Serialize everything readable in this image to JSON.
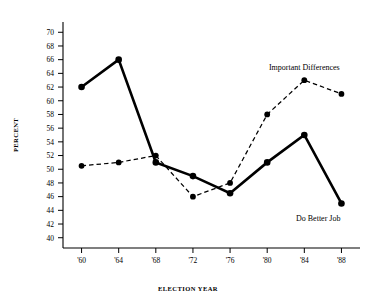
{
  "chart_data": {
    "type": "line",
    "title": "",
    "subtitle": "",
    "xlabel": "ELECTION YEAR",
    "ylabel": "PERCENT",
    "x": [
      1960,
      1964,
      1968,
      1972,
      1976,
      1980,
      1984,
      1988
    ],
    "categories": [
      "'60",
      "'64",
      "'68",
      "'72",
      "'76",
      "'80",
      "'84",
      "'88"
    ],
    "xtick_labels": [
      "'60",
      "'64",
      "'68",
      "'72",
      "'76",
      "'80",
      "'84",
      "'88"
    ],
    "ytick_labels": [
      "40",
      "42",
      "44",
      "46",
      "48",
      "50",
      "52",
      "54",
      "56",
      "58",
      "60",
      "62",
      "64",
      "66",
      "68",
      "70"
    ],
    "ytick_values": [
      40,
      42,
      44,
      46,
      48,
      50,
      52,
      54,
      56,
      58,
      60,
      62,
      64,
      66,
      68,
      70
    ],
    "ylim": [
      38.5,
      71.5
    ],
    "xlim": [
      1958,
      1990
    ],
    "grid": false,
    "legend_position": "inline-annotation",
    "series": [
      {
        "name": "Do Better Job",
        "style": "solid",
        "color": "#000000",
        "marker": "circle",
        "values": [
          62,
          66,
          51,
          49,
          46.5,
          51,
          55,
          45
        ]
      },
      {
        "name": "Important Differences",
        "style": "dashed",
        "color": "#000000",
        "marker": "circle",
        "values": [
          50.5,
          51,
          52,
          46,
          48,
          58,
          63,
          61
        ]
      }
    ],
    "annotations": [
      {
        "text": "Important Differences",
        "series": "Important Differences",
        "anchor_x": 1984,
        "anchor_y": 64.5
      },
      {
        "text": "Do Better Job",
        "series": "Do Better Job",
        "anchor_x": 1985.5,
        "anchor_y": 42.5
      }
    ]
  }
}
